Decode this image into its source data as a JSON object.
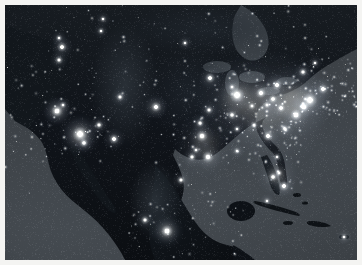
{
  "figure": {
    "name": "earth-at-night-north-america",
    "description": "Composite satellite night-lights image of North America showing city lights across the United States, southern Canada, Mexico, and the Caribbean.",
    "width_px": 362,
    "height_px": 265,
    "border_color": "#f4f4f2",
    "border_px": 5
  },
  "palette": {
    "ocean": "#3c4146",
    "land_dark": "#0d1013",
    "land_mid": "#1a1f24",
    "land_light": "#2a3036",
    "light_core": "#ffffff",
    "light_warm": "#fff9e8",
    "light_halo": "#9fb0c4"
  },
  "regions": [
    {
      "name": "pacific-ocean",
      "label": "Pacific Ocean",
      "type": "water"
    },
    {
      "name": "atlantic-ocean",
      "label": "Atlantic Ocean",
      "type": "water"
    },
    {
      "name": "gulf-of-mexico",
      "label": "Gulf of Mexico",
      "type": "water"
    },
    {
      "name": "caribbean-sea",
      "label": "Caribbean Sea",
      "type": "water"
    },
    {
      "name": "hudson-bay",
      "label": "Hudson Bay",
      "type": "water"
    },
    {
      "name": "great-lakes",
      "label": "Great Lakes",
      "type": "water"
    },
    {
      "name": "canada",
      "label": "Canada",
      "type": "land"
    },
    {
      "name": "united-states",
      "label": "United States",
      "type": "land"
    },
    {
      "name": "mexico",
      "label": "Mexico",
      "type": "land"
    },
    {
      "name": "baja-california",
      "label": "Baja California",
      "type": "land"
    },
    {
      "name": "cuba",
      "label": "Cuba",
      "type": "land"
    },
    {
      "name": "hispaniola",
      "label": "Hispaniola",
      "type": "land"
    },
    {
      "name": "puerto-rico",
      "label": "Puerto Rico",
      "type": "land"
    },
    {
      "name": "bahamas",
      "label": "Bahamas",
      "type": "land"
    },
    {
      "name": "central-america",
      "label": "Central America",
      "type": "land"
    }
  ],
  "city_lights": [
    {
      "name": "new-york-metro",
      "label": "New York",
      "x": 305,
      "y": 95,
      "r": 9,
      "i": 1.0
    },
    {
      "name": "boston",
      "label": "Boston",
      "x": 318,
      "y": 84,
      "r": 6,
      "i": 0.92
    },
    {
      "name": "philadelphia",
      "label": "Philadelphia",
      "x": 299,
      "y": 102,
      "r": 6,
      "i": 0.94
    },
    {
      "name": "baltimore-dc",
      "label": "Washington DC",
      "x": 291,
      "y": 110,
      "r": 7,
      "i": 0.93
    },
    {
      "name": "pittsburgh",
      "label": "Pittsburgh",
      "x": 276,
      "y": 103,
      "r": 5,
      "i": 0.8
    },
    {
      "name": "cleveland",
      "label": "Cleveland",
      "x": 268,
      "y": 94,
      "r": 5,
      "i": 0.82
    },
    {
      "name": "detroit",
      "label": "Detroit",
      "x": 256,
      "y": 88,
      "r": 6,
      "i": 0.88
    },
    {
      "name": "chicago",
      "label": "Chicago",
      "x": 232,
      "y": 90,
      "r": 9,
      "i": 1.0
    },
    {
      "name": "milwaukee",
      "label": "Milwaukee",
      "x": 227,
      "y": 82,
      "r": 4,
      "i": 0.76
    },
    {
      "name": "minneapolis",
      "label": "Minneapolis",
      "x": 205,
      "y": 73,
      "r": 6,
      "i": 0.86
    },
    {
      "name": "st-louis",
      "label": "St. Louis",
      "x": 227,
      "y": 110,
      "r": 5,
      "i": 0.82
    },
    {
      "name": "kansas-city",
      "label": "Kansas City",
      "x": 204,
      "y": 105,
      "r": 5,
      "i": 0.78
    },
    {
      "name": "indianapolis",
      "label": "Indianapolis",
      "x": 247,
      "y": 101,
      "r": 4,
      "i": 0.76
    },
    {
      "name": "columbus",
      "label": "Columbus",
      "x": 262,
      "y": 100,
      "r": 4,
      "i": 0.76
    },
    {
      "name": "nashville",
      "label": "Nashville",
      "x": 249,
      "y": 120,
      "r": 4,
      "i": 0.74
    },
    {
      "name": "memphis",
      "label": "Memphis",
      "x": 232,
      "y": 124,
      "r": 4,
      "i": 0.72
    },
    {
      "name": "atlanta",
      "label": "Atlanta",
      "x": 263,
      "y": 131,
      "r": 6,
      "i": 0.9
    },
    {
      "name": "charlotte",
      "label": "Charlotte",
      "x": 280,
      "y": 124,
      "r": 5,
      "i": 0.8
    },
    {
      "name": "miami",
      "label": "Miami",
      "x": 279,
      "y": 181,
      "r": 6,
      "i": 0.95
    },
    {
      "name": "tampa",
      "label": "Tampa",
      "x": 268,
      "y": 172,
      "r": 5,
      "i": 0.88
    },
    {
      "name": "orlando",
      "label": "Orlando",
      "x": 274,
      "y": 168,
      "r": 4,
      "i": 0.82
    },
    {
      "name": "jacksonville",
      "label": "Jacksonville",
      "x": 272,
      "y": 152,
      "r": 4,
      "i": 0.78
    },
    {
      "name": "new-orleans",
      "label": "New Orleans",
      "x": 232,
      "y": 146,
      "r": 4,
      "i": 0.8
    },
    {
      "name": "houston",
      "label": "Houston",
      "x": 203,
      "y": 152,
      "r": 7,
      "i": 0.95
    },
    {
      "name": "dallas",
      "label": "Dallas",
      "x": 197,
      "y": 131,
      "r": 7,
      "i": 0.93
    },
    {
      "name": "san-antonio",
      "label": "San Antonio",
      "x": 187,
      "y": 152,
      "r": 5,
      "i": 0.82
    },
    {
      "name": "austin",
      "label": "Austin",
      "x": 191,
      "y": 145,
      "r": 4,
      "i": 0.76
    },
    {
      "name": "oklahoma-city",
      "label": "Oklahoma City",
      "x": 195,
      "y": 118,
      "r": 5,
      "i": 0.78
    },
    {
      "name": "denver",
      "label": "Denver",
      "x": 151,
      "y": 102,
      "r": 6,
      "i": 0.88
    },
    {
      "name": "salt-lake-city",
      "label": "Salt Lake City",
      "x": 115,
      "y": 92,
      "r": 5,
      "i": 0.8
    },
    {
      "name": "phoenix",
      "label": "Phoenix",
      "x": 109,
      "y": 134,
      "r": 6,
      "i": 0.9
    },
    {
      "name": "las-vegas",
      "label": "Las Vegas",
      "x": 94,
      "y": 120,
      "r": 5,
      "i": 0.86
    },
    {
      "name": "los-angeles",
      "label": "Los Angeles",
      "x": 75,
      "y": 129,
      "r": 9,
      "i": 1.0
    },
    {
      "name": "san-diego",
      "label": "San Diego",
      "x": 79,
      "y": 138,
      "r": 5,
      "i": 0.88
    },
    {
      "name": "san-francisco",
      "label": "San Francisco",
      "x": 52,
      "y": 106,
      "r": 7,
      "i": 0.95
    },
    {
      "name": "sacramento",
      "label": "Sacramento",
      "x": 58,
      "y": 100,
      "r": 4,
      "i": 0.78
    },
    {
      "name": "portland",
      "label": "Portland",
      "x": 54,
      "y": 55,
      "r": 5,
      "i": 0.8
    },
    {
      "name": "seattle",
      "label": "Seattle",
      "x": 57,
      "y": 42,
      "r": 6,
      "i": 0.86
    },
    {
      "name": "vancouver",
      "label": "Vancouver",
      "x": 54,
      "y": 33,
      "r": 4,
      "i": 0.78
    },
    {
      "name": "calgary",
      "label": "Calgary",
      "x": 96,
      "y": 26,
      "r": 4,
      "i": 0.72
    },
    {
      "name": "edmonton",
      "label": "Edmonton",
      "x": 98,
      "y": 14,
      "r": 4,
      "i": 0.7
    },
    {
      "name": "winnipeg",
      "label": "Winnipeg",
      "x": 180,
      "y": 38,
      "r": 4,
      "i": 0.72
    },
    {
      "name": "toronto",
      "label": "Toronto",
      "x": 272,
      "y": 80,
      "r": 6,
      "i": 0.88
    },
    {
      "name": "montreal",
      "label": "Montreal",
      "x": 298,
      "y": 67,
      "r": 5,
      "i": 0.84
    },
    {
      "name": "quebec",
      "label": "Quebec",
      "x": 310,
      "y": 58,
      "r": 4,
      "i": 0.72
    },
    {
      "name": "mexico-city",
      "label": "Mexico City",
      "x": 162,
      "y": 226,
      "r": 7,
      "i": 0.98
    },
    {
      "name": "guadalajara",
      "label": "Guadalajara",
      "x": 140,
      "y": 215,
      "r": 5,
      "i": 0.84
    },
    {
      "name": "monterrey",
      "label": "Monterrey",
      "x": 176,
      "y": 175,
      "r": 5,
      "i": 0.82
    },
    {
      "name": "havana",
      "label": "Havana",
      "x": 262,
      "y": 196,
      "r": 4,
      "i": 0.76
    },
    {
      "name": "san-juan",
      "label": "San Juan",
      "x": 339,
      "y": 232,
      "r": 4,
      "i": 0.9
    }
  ],
  "annotations": {
    "visible_text": []
  }
}
